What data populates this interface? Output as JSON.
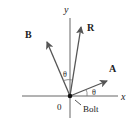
{
  "diagram": {
    "axes": {
      "x_label": "x",
      "y_label": "y",
      "origin_label": "0"
    },
    "vectors": [
      {
        "name": "A",
        "label": "A"
      },
      {
        "name": "B",
        "label": "B"
      },
      {
        "name": "R",
        "label": "R"
      }
    ],
    "angles": [
      {
        "label": "θ",
        "between": "A and x-axis"
      },
      {
        "label": "θ",
        "between": "R and B"
      }
    ],
    "annotation": {
      "label": "Bolt",
      "target": "origin"
    },
    "colors": {
      "axis": "#555555",
      "vector": "#555555",
      "text": "#222222"
    }
  }
}
